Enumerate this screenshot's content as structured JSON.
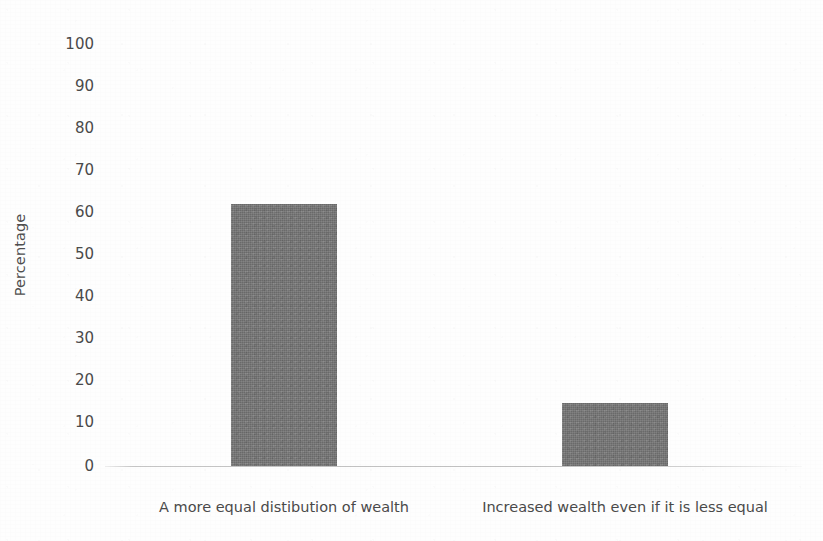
{
  "chart_data": {
    "type": "bar",
    "title": "",
    "subtitle": "",
    "xlabel": "",
    "ylabel": "Percentage",
    "ylim": [
      0,
      100
    ],
    "y_ticks": [
      "0",
      "10",
      "20",
      "30",
      "40",
      "50",
      "60",
      "70",
      "80",
      "90",
      "100"
    ],
    "grid": false,
    "legend": null,
    "categories": [
      "A more equal distibution of wealth",
      "Increased wealth even if it is less equal"
    ],
    "values": [
      62,
      15
    ],
    "bar_color": "#757575",
    "background_color": "#fefefe",
    "axis_color": "#969696",
    "text_color": "#4a4a4a"
  },
  "axis": {
    "y_title": "Percentage",
    "ticks": [
      {
        "label": "100",
        "value": 100
      },
      {
        "label": "90",
        "value": 90
      },
      {
        "label": "80",
        "value": 80
      },
      {
        "label": "70",
        "value": 70
      },
      {
        "label": "60",
        "value": 60
      },
      {
        "label": "50",
        "value": 50
      },
      {
        "label": "40",
        "value": 40
      },
      {
        "label": "30",
        "value": 30
      },
      {
        "label": "20",
        "value": 20
      },
      {
        "label": "10",
        "value": 10
      },
      {
        "label": "0",
        "value": 0
      }
    ]
  },
  "bars": [
    {
      "label": "A more equal distibution of wealth",
      "value": 62
    },
    {
      "label": "Increased wealth even if it is less equal",
      "value": 15
    }
  ]
}
